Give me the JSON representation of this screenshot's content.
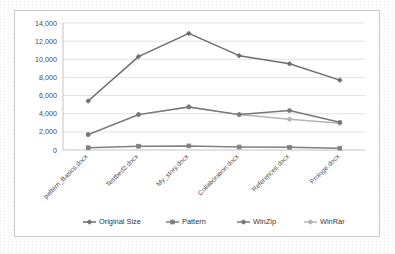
{
  "chart_data": {
    "type": "line",
    "title": "",
    "xlabel": "",
    "ylabel": "",
    "ylim": [
      0,
      14000
    ],
    "ytick_step": 2000,
    "grid": true,
    "legend_position": "bottom",
    "ytick_labels": [
      "0",
      "2,000",
      "4,000",
      "6,000",
      "8,000",
      "10,000",
      "12,000",
      "14,000"
    ],
    "ytick_values": [
      0,
      2000,
      4000,
      6000,
      8000,
      10000,
      12000,
      14000
    ],
    "categories": [
      "pattern_Basics.docx",
      "Testbed2.docx",
      "My_story.docx",
      "Collaboration.docx",
      "References.docx",
      "Prologe.docx"
    ],
    "series": [
      {
        "name": "Original Size",
        "color": "#6d6d6d",
        "marker": "diamond",
        "values": [
          5400,
          10300,
          12850,
          10400,
          9500,
          7700
        ]
      },
      {
        "name": "Pattern",
        "color": "#808080",
        "marker": "square",
        "values": [
          250,
          420,
          450,
          330,
          300,
          200
        ]
      },
      {
        "name": "WinZip",
        "color": "#787878",
        "marker": "circle",
        "values": [
          1700,
          3900,
          4750,
          3900,
          4350,
          3050
        ]
      },
      {
        "name": "WinRar",
        "color": "#b4b4b4",
        "marker": "circle",
        "values": [
          1700,
          3900,
          4750,
          3900,
          3400,
          2950
        ]
      }
    ]
  },
  "legend": {
    "items": [
      {
        "label": "Original Size"
      },
      {
        "label": "Pattern"
      },
      {
        "label": "WinZip"
      },
      {
        "label": "WinRar"
      }
    ]
  },
  "colors": {
    "frame_border": "#c9c9c9",
    "gridline": "#d6d6d6",
    "axis": "#b5b5b5",
    "tick_text": "#4a4a4a",
    "background": "#fdfdfd"
  }
}
